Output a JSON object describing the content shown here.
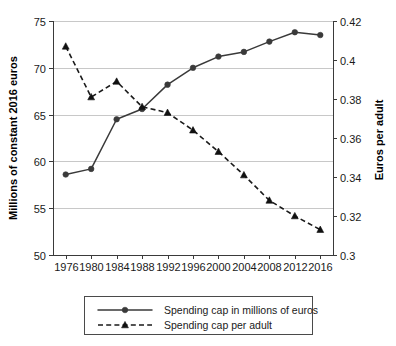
{
  "chart_data": {
    "type": "line",
    "title": "",
    "subtitle": "",
    "xlabel": "",
    "ylabel": "Millions of constant 2016 euros",
    "y2label": "Euros per adult",
    "x": [
      1976,
      1980,
      1984,
      1988,
      1992,
      1996,
      2000,
      2004,
      2008,
      2012,
      2016
    ],
    "xticklabels": [
      "1976",
      "1980",
      "1984",
      "1988",
      "1992",
      "1996",
      "2000",
      "2004",
      "2008",
      "2012",
      "2016"
    ],
    "xlim": [
      1974,
      2018
    ],
    "ylim": [
      50,
      75
    ],
    "yticks": [
      50,
      55,
      60,
      65,
      70,
      75
    ],
    "yticklabels": [
      "50",
      "55",
      "60",
      "65",
      "70",
      "75"
    ],
    "y2lim": [
      0.3,
      0.42
    ],
    "y2ticks": [
      0.3,
      0.32,
      0.34,
      0.36,
      0.38,
      0.4,
      0.42
    ],
    "y2ticklabels": [
      "0.3",
      "0.32",
      "0.34",
      "0.36",
      "0.38",
      "0.4",
      "0.42"
    ],
    "grid": true,
    "grid_axis": "y",
    "legend_position": "below",
    "series": [
      {
        "name": "Spending cap in millions of euros",
        "axis": "left",
        "linestyle": "solid",
        "marker": "circle",
        "color": "#3a3a3a",
        "values": [
          58.6,
          59.2,
          64.5,
          65.6,
          68.2,
          70.0,
          71.2,
          71.7,
          72.8,
          73.8,
          73.5
        ]
      },
      {
        "name": "Spending cap per adult",
        "axis": "right",
        "linestyle": "dashed",
        "marker": "triangle",
        "color": "#111111",
        "values": [
          0.407,
          0.381,
          0.389,
          0.376,
          0.373,
          0.364,
          0.353,
          0.341,
          0.328,
          0.32,
          0.313
        ]
      }
    ]
  },
  "legend": {
    "entries": [
      {
        "label": "Spending cap in millions of euros"
      },
      {
        "label": "Spending cap per adult"
      }
    ]
  },
  "colors": {
    "series_solid": "#3a3a3a",
    "series_dashed": "#111111",
    "gridline": "#c8c8c8",
    "axis": "#3a3a3a",
    "background": "#ffffff",
    "text": "#1a1a1a"
  }
}
